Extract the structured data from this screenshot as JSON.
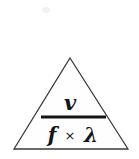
{
  "diagram": {
    "type": "formula-triangle",
    "shape": "triangle",
    "background_color": "#ffffff",
    "outline_color": "#3a3a3a",
    "fill_color": "#fefefe",
    "text_color": "#141414",
    "geometry": {
      "apex_x": 70,
      "apex_y": 58,
      "bottom_left_x": 14,
      "bottom_right_x": 128,
      "baseline_y": 149,
      "fraction_bar_x1": 41,
      "fraction_bar_x2": 106,
      "fraction_bar_y": 117
    },
    "formula": {
      "numerator": "v",
      "denominator_left": "f",
      "denominator_operator": "×",
      "denominator_right": "λ",
      "denominator_full": "f × λ",
      "expression": "v / (f × λ)"
    }
  }
}
